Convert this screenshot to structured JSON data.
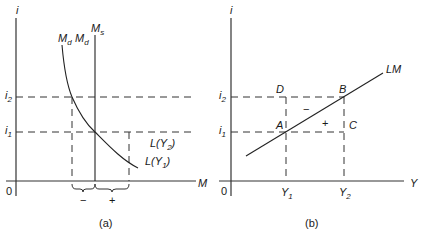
{
  "panel_a": {
    "caption": "(a)",
    "y_axis_label": "i",
    "x_axis_label": "M",
    "origin_label": "0",
    "tick_i2": {
      "main": "i",
      "sub": "2"
    },
    "tick_i1": {
      "main": "i",
      "sub": "1"
    },
    "curve_label_md1": {
      "main": "M",
      "sub": "d"
    },
    "curve_label_md2": {
      "main": "M",
      "sub": "d"
    },
    "supply_label": {
      "main": "M",
      "sub": "s"
    },
    "curve_label_LY2": {
      "pre": "L(Y",
      "sub": "2",
      "post": ")"
    },
    "curve_label_LY1": {
      "pre": "L(Y",
      "sub": "1",
      "post": ")"
    },
    "minus_sign": "−",
    "plus_sign": "+"
  },
  "panel_b": {
    "caption": "(b)",
    "y_axis_label": "i",
    "x_axis_label": "Y",
    "origin_label": "0",
    "tick_i2": {
      "main": "i",
      "sub": "2"
    },
    "tick_i1": {
      "main": "i",
      "sub": "1"
    },
    "tick_Y1": {
      "main": "Y",
      "sub": "1"
    },
    "tick_Y2": {
      "main": "Y",
      "sub": "2"
    },
    "curve_label": "LM",
    "point_A": "A",
    "point_B": "B",
    "point_C": "C",
    "point_D": "D",
    "minus_sign": "−",
    "plus_sign": "+"
  },
  "colors": {
    "line": "#222222",
    "background": "#ffffff"
  }
}
